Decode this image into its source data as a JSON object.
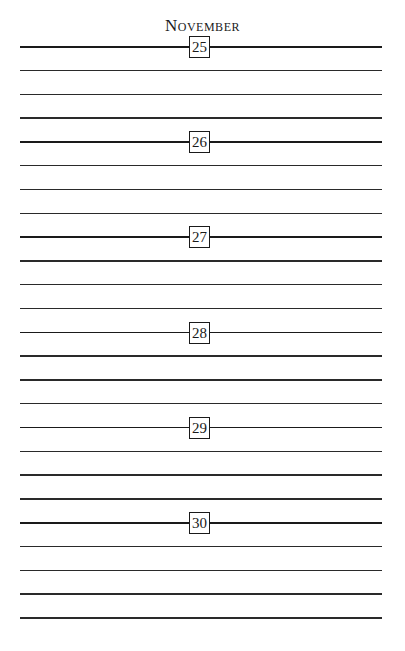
{
  "page": {
    "month": "November",
    "days": [
      {
        "label": "25"
      },
      {
        "label": "26"
      },
      {
        "label": "27"
      },
      {
        "label": "28"
      },
      {
        "label": "29"
      },
      {
        "label": "30"
      }
    ],
    "lines_per_day": 4,
    "total_lines": 25
  }
}
